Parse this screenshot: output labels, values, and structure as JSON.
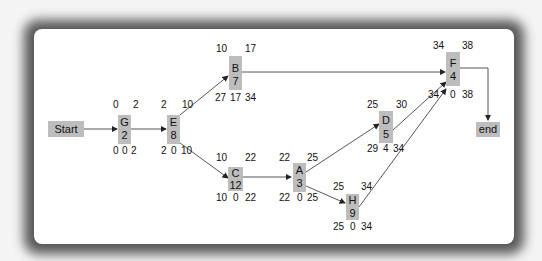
{
  "diagram": {
    "type": "activity-on-node network (critical path)",
    "nodes": [
      {
        "id": "start",
        "label": "Start"
      },
      {
        "id": "G",
        "name": "G",
        "duration": "2",
        "es": "0",
        "ef": "2",
        "ls": "0",
        "slack": "0",
        "lf": "2"
      },
      {
        "id": "E",
        "name": "E",
        "duration": "8",
        "es": "2",
        "ef": "10",
        "ls": "2",
        "slack": "0",
        "lf": "10"
      },
      {
        "id": "B",
        "name": "B",
        "duration": "7",
        "es": "10",
        "ef": "17",
        "ls": "27",
        "slack": "17",
        "lf": "34"
      },
      {
        "id": "C",
        "name": "C",
        "duration": "12",
        "es": "10",
        "ef": "22",
        "ls": "10",
        "slack": "0",
        "lf": "22"
      },
      {
        "id": "A",
        "name": "A",
        "duration": "3",
        "es": "22",
        "ef": "25",
        "ls": "22",
        "slack": "0",
        "lf": "25"
      },
      {
        "id": "D",
        "name": "D",
        "duration": "5",
        "es": "25",
        "ef": "30",
        "ls": "29",
        "slack": "4",
        "lf": "34"
      },
      {
        "id": "H",
        "name": "H",
        "duration": "9",
        "es": "25",
        "ef": "34",
        "ls": "25",
        "slack": "0",
        "lf": "34"
      },
      {
        "id": "F",
        "name": "F",
        "duration": "4",
        "es": "34",
        "ef": "38",
        "ls": "34",
        "slack": "0",
        "lf": "38"
      },
      {
        "id": "end",
        "label": "end"
      }
    ],
    "edges": [
      [
        "start",
        "G"
      ],
      [
        "G",
        "E"
      ],
      [
        "E",
        "B"
      ],
      [
        "E",
        "C"
      ],
      [
        "B",
        "F"
      ],
      [
        "C",
        "A"
      ],
      [
        "A",
        "D"
      ],
      [
        "A",
        "H"
      ],
      [
        "D",
        "F"
      ],
      [
        "H",
        "F"
      ],
      [
        "F",
        "end"
      ]
    ]
  },
  "colors": {
    "node_fill": "#bdbdbd",
    "line": "#333333",
    "background": "#ffffff",
    "frame": "#3a3a3a"
  }
}
